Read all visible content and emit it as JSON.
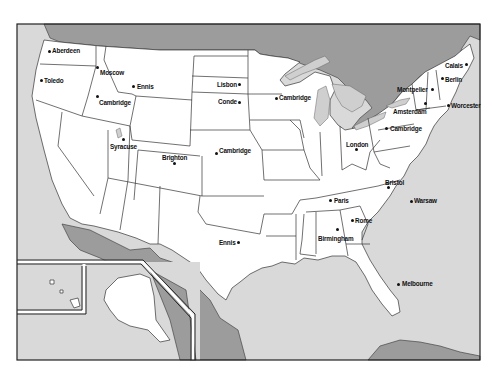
{
  "map": {
    "title": "",
    "colors": {
      "water": "#d9d9d9",
      "foreign_land": "#9c9c9c",
      "us_land": "#ffffff",
      "border": "#333333"
    },
    "cities": [
      {
        "name": "Aberdeen",
        "dot": [
          49,
          51
        ],
        "label": [
          52,
          46
        ]
      },
      {
        "name": "Toledo",
        "dot": [
          41,
          80
        ],
        "label": [
          44,
          76
        ]
      },
      {
        "name": "Moscow",
        "dot": [
          97,
          67
        ],
        "label": [
          100,
          68
        ]
      },
      {
        "name": "Ennis",
        "dot": [
          133,
          86
        ],
        "label": [
          137,
          82
        ]
      },
      {
        "name": "Cambridge",
        "dot": [
          97,
          96
        ],
        "label": [
          99,
          98
        ]
      },
      {
        "name": "Lisbon",
        "dot": [
          239,
          84
        ],
        "label": [
          217,
          80
        ]
      },
      {
        "name": "Conde",
        "dot": [
          239,
          102
        ],
        "label": [
          218,
          97
        ]
      },
      {
        "name": "Cambridge",
        "dot": [
          276,
          98
        ],
        "label": [
          279,
          93
        ]
      },
      {
        "name": "Syracuse",
        "dot": [
          123,
          139
        ],
        "label": [
          110,
          142
        ]
      },
      {
        "name": "Brighton",
        "dot": [
          174,
          163
        ],
        "label": [
          162,
          153
        ]
      },
      {
        "name": "Cambridge",
        "dot": [
          216,
          153
        ],
        "label": [
          219,
          146
        ]
      },
      {
        "name": "Ennis",
        "dot": [
          238,
          242
        ],
        "label": [
          219,
          238
        ]
      },
      {
        "name": "Calais",
        "dot": [
          466,
          64
        ],
        "label": [
          445,
          61
        ]
      },
      {
        "name": "Berlin",
        "dot": [
          442,
          78
        ],
        "label": [
          445,
          75
        ]
      },
      {
        "name": "Montpelier",
        "dot": [
          432,
          89
        ],
        "label": [
          397,
          85
        ]
      },
      {
        "name": "Amsterdam",
        "dot": [
          425,
          103
        ],
        "label": [
          393,
          107
        ]
      },
      {
        "name": "Worcester",
        "dot": [
          448,
          105
        ],
        "label": [
          451,
          101
        ]
      },
      {
        "name": "Cambridge",
        "dot": [
          386,
          128
        ],
        "label": [
          390,
          124
        ]
      },
      {
        "name": "London",
        "dot": [
          356,
          149
        ],
        "label": [
          346,
          140
        ]
      },
      {
        "name": "Bristol",
        "dot": [
          388,
          187
        ],
        "label": [
          385,
          178
        ]
      },
      {
        "name": "Paris",
        "dot": [
          330,
          200
        ],
        "label": [
          334,
          196
        ]
      },
      {
        "name": "Warsaw",
        "dot": [
          411,
          201
        ],
        "label": [
          414,
          196
        ]
      },
      {
        "name": "Rome",
        "dot": [
          352,
          220
        ],
        "label": [
          355,
          216
        ]
      },
      {
        "name": "Birmingham",
        "dot": [
          337,
          229
        ],
        "label": [
          318,
          234
        ]
      },
      {
        "name": "Melbourne",
        "dot": [
          398,
          284
        ],
        "label": [
          402,
          279
        ]
      }
    ]
  }
}
